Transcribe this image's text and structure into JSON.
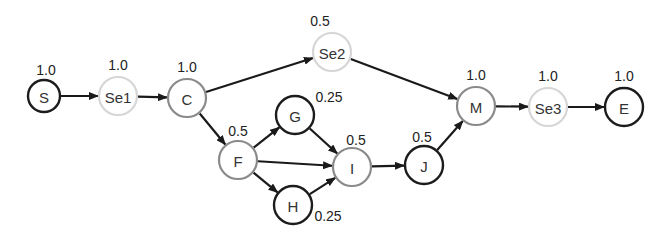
{
  "diagram": {
    "type": "directed-graph",
    "arrowColor": "#1a1a1a",
    "strokeColors": {
      "dark": "#1c1c1c",
      "medium": "#8a8a8a",
      "light": "#d6d6d6"
    },
    "nodes": [
      {
        "id": "S",
        "label": "S",
        "weight": "1.0",
        "x": 44,
        "y": 96,
        "r": 16,
        "style": "dark",
        "wx": 46,
        "wy": 75
      },
      {
        "id": "Se1",
        "label": "Se1",
        "weight": "1.0",
        "x": 118,
        "y": 96,
        "r": 19,
        "style": "light",
        "wx": 118,
        "wy": 70
      },
      {
        "id": "C",
        "label": "C",
        "weight": "1.0",
        "x": 187,
        "y": 98,
        "r": 19,
        "style": "medium",
        "wx": 187,
        "wy": 72
      },
      {
        "id": "Se2",
        "label": "Se2",
        "weight": "0.5",
        "x": 332,
        "y": 52,
        "r": 19,
        "style": "light",
        "wx": 320,
        "wy": 26
      },
      {
        "id": "F",
        "label": "F",
        "weight": "0.5",
        "x": 238,
        "y": 160,
        "r": 19,
        "style": "medium",
        "wx": 238,
        "wy": 136
      },
      {
        "id": "G",
        "label": "G",
        "weight": "0.25",
        "x": 295,
        "y": 115,
        "r": 19,
        "style": "dark",
        "wx": 329,
        "wy": 102
      },
      {
        "id": "H",
        "label": "H",
        "weight": "0.25",
        "x": 293,
        "y": 205,
        "r": 19,
        "style": "dark",
        "wx": 328,
        "wy": 221
      },
      {
        "id": "I",
        "label": "I",
        "weight": "0.5",
        "x": 352,
        "y": 167,
        "r": 19,
        "style": "medium",
        "wx": 356,
        "wy": 145
      },
      {
        "id": "J",
        "label": "J",
        "weight": "0.5",
        "x": 424,
        "y": 165,
        "r": 19,
        "style": "dark",
        "wx": 422,
        "wy": 142
      },
      {
        "id": "M",
        "label": "M",
        "weight": "1.0",
        "x": 476,
        "y": 106,
        "r": 19,
        "style": "medium",
        "wx": 476,
        "wy": 80
      },
      {
        "id": "Se3",
        "label": "Se3",
        "weight": "1.0",
        "x": 548,
        "y": 107,
        "r": 19,
        "style": "light",
        "wx": 548,
        "wy": 81
      },
      {
        "id": "E",
        "label": "E",
        "weight": "1.0",
        "x": 624,
        "y": 107,
        "r": 19,
        "style": "dark",
        "wx": 624,
        "wy": 81
      }
    ],
    "edges": [
      {
        "from": "S",
        "to": "Se1"
      },
      {
        "from": "Se1",
        "to": "C"
      },
      {
        "from": "C",
        "to": "Se2"
      },
      {
        "from": "C",
        "to": "F"
      },
      {
        "from": "Se2",
        "to": "M"
      },
      {
        "from": "F",
        "to": "G"
      },
      {
        "from": "F",
        "to": "I"
      },
      {
        "from": "F",
        "to": "H"
      },
      {
        "from": "G",
        "to": "I"
      },
      {
        "from": "H",
        "to": "I"
      },
      {
        "from": "I",
        "to": "J"
      },
      {
        "from": "J",
        "to": "M"
      },
      {
        "from": "M",
        "to": "Se3"
      },
      {
        "from": "Se3",
        "to": "E"
      }
    ]
  }
}
